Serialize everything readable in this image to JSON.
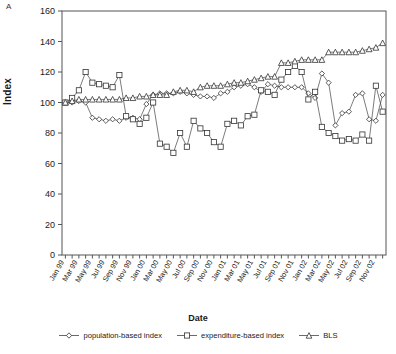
{
  "panel": {
    "label": "A"
  },
  "axes": {
    "ylabel": "Index",
    "xlabel": "Date",
    "yticks": [
      0,
      20,
      40,
      60,
      80,
      100,
      120,
      140,
      160
    ]
  },
  "legend": {
    "items": [
      {
        "label": "population-based index",
        "marker": "diamond",
        "name": "legend-population-based-index"
      },
      {
        "label": "expenditure-based index",
        "marker": "square",
        "name": "legend-expenditure-based-index"
      },
      {
        "label": "BLS",
        "marker": "triangle",
        "name": "legend-bls"
      }
    ]
  },
  "chart_data": {
    "type": "line",
    "title": "",
    "xlabel": "Date",
    "ylabel": "Index",
    "ylim": [
      0,
      160
    ],
    "ytick_step": 20,
    "grid": false,
    "legend_position": "bottom",
    "x": [
      "Jan 99",
      "Feb 99",
      "Mar 99",
      "Apr 99",
      "May 99",
      "Jun 99",
      "Jul 99",
      "Aug 99",
      "Sep 99",
      "Oct 99",
      "Nov 99",
      "Dec 99",
      "Jan 00",
      "Feb 00",
      "Mar 00",
      "Apr 00",
      "May 00",
      "Jun 00",
      "Jul 00",
      "Aug 00",
      "Sep 00",
      "Oct 00",
      "Nov 00",
      "Dec 00",
      "Jan 01",
      "Feb 01",
      "Mar 01",
      "Apr 01",
      "May 01",
      "Jun 01",
      "Jul 01",
      "Aug 01",
      "Sep 01",
      "Oct 01",
      "Nov 01",
      "Dec 01",
      "Jan 02",
      "Feb 02",
      "Mar 02",
      "Apr 02",
      "May 02",
      "Jun 02",
      "Jul 02",
      "Aug 02",
      "Sep 02",
      "Oct 02",
      "Nov 02",
      "Dec 02"
    ],
    "xtick_labels": [
      "Jan 99",
      "Mar 99",
      "May 99",
      "Jul 99",
      "Sep 99",
      "Nov 99",
      "Jan 00",
      "Mar 00",
      "May 00",
      "Jul 00",
      "Sep 00",
      "Nov 00",
      "Jan 01",
      "Mar 01",
      "May 01",
      "Jul 01",
      "Sep 01",
      "Nov 01",
      "Jan 02",
      "Mar 02",
      "May 02",
      "Jul 02",
      "Sep 02",
      "Nov 02"
    ],
    "xtick_every": 2,
    "series": [
      {
        "name": "population-based index",
        "marker": "diamond",
        "values": [
          100,
          100,
          101,
          100,
          90,
          89,
          88,
          89,
          88,
          90,
          90,
          89,
          99,
          105,
          106,
          106,
          106,
          107,
          106,
          105,
          104,
          104,
          103,
          106,
          107,
          110,
          111,
          112,
          110,
          107,
          112,
          111,
          110,
          110,
          110,
          110,
          106,
          103,
          119,
          113,
          85,
          93,
          94,
          105,
          106,
          89,
          88,
          105
        ]
      },
      {
        "name": "expenditure-based index",
        "marker": "square",
        "values": [
          100,
          103,
          108,
          120,
          113,
          112,
          111,
          110,
          118,
          91,
          89,
          86,
          90,
          100,
          73,
          71,
          67,
          80,
          71,
          88,
          83,
          80,
          74,
          71,
          86,
          88,
          85,
          91,
          92,
          108,
          107,
          105,
          115,
          120,
          124,
          120,
          102,
          107,
          84,
          80,
          78,
          75,
          76,
          75,
          79,
          75,
          111,
          94
        ]
      },
      {
        "name": "BLS",
        "marker": "triangle",
        "values": [
          100,
          101,
          102,
          102,
          102,
          102,
          102,
          102,
          102,
          103,
          103,
          104,
          104,
          105,
          105,
          105,
          107,
          108,
          108,
          107,
          110,
          111,
          111,
          111,
          112,
          113,
          113,
          114,
          115,
          116,
          117,
          117,
          126,
          126,
          127,
          128,
          128,
          128,
          128,
          133,
          133,
          133,
          133,
          133,
          134,
          135,
          136,
          139
        ]
      }
    ]
  }
}
